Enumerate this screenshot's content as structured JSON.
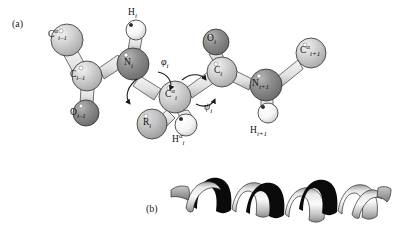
{
  "figure": {
    "caption_panels": [
      {
        "id": "a",
        "tag": "(a)",
        "description": "ball-and-stick peptide backbone with dihedral angles"
      },
      {
        "id": "b",
        "tag": "(b)",
        "description": "alpha-helix ribbon cartoon"
      }
    ]
  },
  "panel_a": {
    "tag": "(a)",
    "atoms": [
      {
        "key": "ca_im1",
        "element": "C",
        "superscript": "α",
        "subscript": "i–1",
        "label": "C",
        "type": "carbon-alpha",
        "color": "#c9c9c9",
        "radius": 16,
        "cx": 67,
        "cy": 40
      },
      {
        "key": "c_im1",
        "element": "C",
        "superscript": "",
        "subscript": "i–1",
        "label": "C",
        "type": "carbonyl-carbon",
        "color": "#cfcfcf",
        "radius": 15,
        "cx": 87,
        "cy": 76
      },
      {
        "key": "o_im1",
        "element": "O",
        "superscript": "",
        "subscript": "i–1",
        "label": "O",
        "type": "oxygen",
        "color": "#949494",
        "radius": 13,
        "cx": 86,
        "cy": 113
      },
      {
        "key": "n_i",
        "element": "N",
        "superscript": "",
        "subscript": "i",
        "label": "N",
        "type": "nitrogen",
        "color": "#8d8d8d",
        "radius": 16,
        "cx": 133,
        "cy": 64
      },
      {
        "key": "h_i",
        "element": "H",
        "superscript": "",
        "subscript": "i",
        "label": "H",
        "type": "amide-hydrogen",
        "color": "#fbfbfb",
        "radius": 10,
        "cx": 136,
        "cy": 30
      },
      {
        "key": "ca_i",
        "element": "C",
        "superscript": "α",
        "subscript": "i",
        "label": "C",
        "type": "carbon-alpha",
        "color": "#cccccc",
        "radius": 16,
        "cx": 175,
        "cy": 97
      },
      {
        "key": "r_i",
        "element": "R",
        "superscript": "",
        "subscript": "i",
        "label": "R",
        "type": "side-chain",
        "color": "#c2c2c2",
        "radius": 15,
        "cx": 152,
        "cy": 124
      },
      {
        "key": "ha_i",
        "element": "H",
        "superscript": "α",
        "subscript": "i",
        "label": "H",
        "type": "alpha-hydrogen",
        "color": "#fbfbfb",
        "radius": 11,
        "cx": 186,
        "cy": 125
      },
      {
        "key": "c_i",
        "element": "C",
        "superscript": "",
        "subscript": "i",
        "label": "C",
        "type": "carbonyl-carbon",
        "color": "#cfcfcf",
        "radius": 15,
        "cx": 222,
        "cy": 72
      },
      {
        "key": "o_i",
        "element": "O",
        "superscript": "",
        "subscript": "i",
        "label": "O",
        "type": "oxygen",
        "color": "#949494",
        "radius": 13,
        "cx": 216,
        "cy": 42
      },
      {
        "key": "n_ip1",
        "element": "N",
        "superscript": "",
        "subscript": "i+1",
        "label": "N",
        "type": "nitrogen",
        "color": "#8d8d8d",
        "radius": 16,
        "cx": 266,
        "cy": 85
      },
      {
        "key": "h_ip1",
        "element": "H",
        "superscript": "",
        "subscript": "i+1",
        "label": "H",
        "type": "amide-hydrogen",
        "color": "#fbfbfb",
        "radius": 10,
        "cx": 268,
        "cy": 113
      },
      {
        "key": "ca_ip1",
        "element": "C",
        "superscript": "α",
        "subscript": "i+1",
        "label": "C",
        "type": "carbon-alpha",
        "color": "#c9c9c9",
        "radius": 15,
        "cx": 311,
        "cy": 53
      }
    ],
    "labels": [
      {
        "key": "ca_im1",
        "el": "C",
        "sup": "α",
        "sub": "i–1",
        "x": 48,
        "y": 28
      },
      {
        "key": "c_im1",
        "el": "C",
        "sup": "",
        "sub": "i–1",
        "x": 70,
        "y": 70
      },
      {
        "key": "o_im1",
        "el": "O",
        "sup": "",
        "sub": "i–1",
        "x": 70,
        "y": 108
      },
      {
        "key": "h_i",
        "el": "H",
        "sup": "",
        "sub": "i",
        "x": 128,
        "y": 8
      },
      {
        "key": "n_i",
        "el": "N",
        "sup": "",
        "sub": "i",
        "x": 124,
        "y": 58
      },
      {
        "key": "ca_i",
        "el": "C",
        "sup": "α",
        "sub": "i",
        "x": 165,
        "y": 88
      },
      {
        "key": "r_i",
        "el": "R",
        "sup": "",
        "sub": "i",
        "x": 143,
        "y": 118
      },
      {
        "key": "ha_i",
        "el": "H",
        "sup": "α",
        "sub": "i",
        "x": 172,
        "y": 133
      },
      {
        "key": "o_i",
        "el": "O",
        "sup": "",
        "sub": "i",
        "x": 207,
        "y": 34
      },
      {
        "key": "c_i",
        "el": "C",
        "sup": "",
        "sub": "i",
        "x": 214,
        "y": 66
      },
      {
        "key": "n_ip1",
        "el": "N",
        "sup": "",
        "sub": "i+1",
        "x": 252,
        "y": 79
      },
      {
        "key": "h_ip1",
        "el": "H",
        "sup": "",
        "sub": "i+1",
        "x": 250,
        "y": 126
      },
      {
        "key": "ca_ip1",
        "el": "C",
        "sup": "α",
        "sub": "i+1",
        "x": 300,
        "y": 44
      }
    ],
    "dihedrals": [
      {
        "key": "phi",
        "symbol": "φ",
        "sub": "i",
        "x": 161,
        "y": 56,
        "bond": "N–Cα"
      },
      {
        "key": "psi",
        "symbol": "ψ",
        "sub": "i",
        "x": 204,
        "y": 101,
        "bond": "Cα–C"
      }
    ],
    "bonds": [
      {
        "from": "ca_im1",
        "to": "c_im1"
      },
      {
        "from": "c_im1",
        "to": "o_im1"
      },
      {
        "from": "c_im1",
        "to": "n_i"
      },
      {
        "from": "n_i",
        "to": "h_i"
      },
      {
        "from": "n_i",
        "to": "ca_i"
      },
      {
        "from": "ca_i",
        "to": "r_i"
      },
      {
        "from": "ca_i",
        "to": "ha_i"
      },
      {
        "from": "ca_i",
        "to": "c_i"
      },
      {
        "from": "c_i",
        "to": "o_i"
      },
      {
        "from": "c_i",
        "to": "n_ip1"
      },
      {
        "from": "n_ip1",
        "to": "h_ip1"
      },
      {
        "from": "n_ip1",
        "to": "ca_ip1"
      }
    ]
  },
  "panel_b": {
    "tag": "(b)",
    "structure": "alpha-helix ribbon",
    "turns": 3.5,
    "front_face_color": "#d8d8d8",
    "back_face_color": "#0a0a0a",
    "outline_color": "#2a2a2a"
  }
}
